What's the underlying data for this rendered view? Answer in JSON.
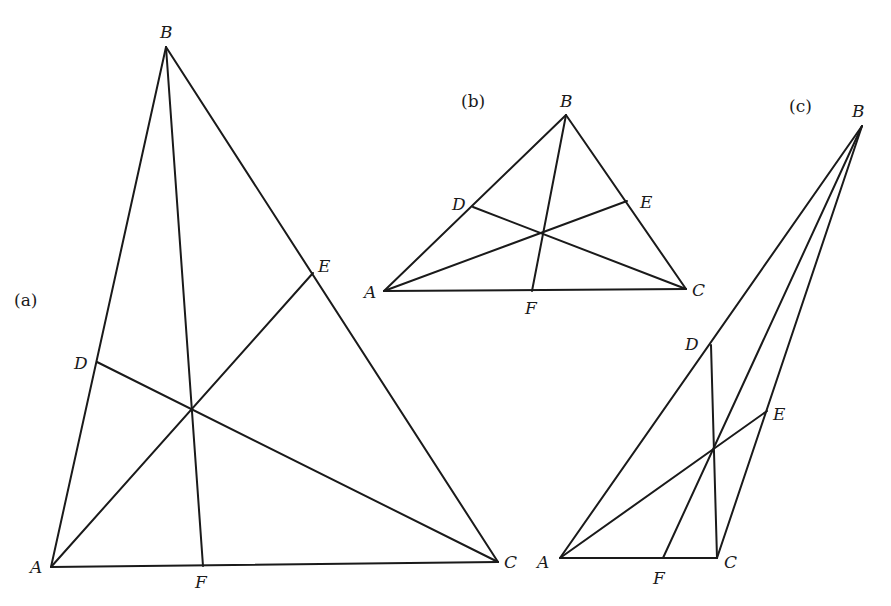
{
  "figures": [
    {
      "id": "a",
      "tag": "(a)",
      "tag_pos": [
        14,
        306
      ],
      "points": {
        "A": {
          "xy": [
            51,
            567
          ],
          "label_pos": [
            30,
            573
          ]
        },
        "B": {
          "xy": [
            166,
            47
          ],
          "label_pos": [
            160,
            38
          ]
        },
        "C": {
          "xy": [
            498,
            562
          ],
          "label_pos": [
            504,
            568
          ]
        },
        "D": {
          "xy": [
            97,
            362
          ],
          "label_pos": [
            74,
            369
          ]
        },
        "E": {
          "xy": [
            313,
            273
          ],
          "label_pos": [
            318,
            272
          ]
        },
        "F": {
          "xy": [
            203,
            566
          ],
          "label_pos": [
            195,
            588
          ]
        }
      },
      "concurrency_point": [
        192,
        407
      ],
      "sides": [
        [
          "A",
          "B"
        ],
        [
          "B",
          "C"
        ],
        [
          "C",
          "A"
        ]
      ],
      "cevians": [
        [
          "A",
          "E"
        ],
        [
          "B",
          "F"
        ],
        [
          "C",
          "D"
        ]
      ]
    },
    {
      "id": "b",
      "tag": "(b)",
      "tag_pos": [
        461,
        107
      ],
      "points": {
        "A": {
          "xy": [
            384,
            291
          ],
          "label_pos": [
            364,
            298
          ]
        },
        "B": {
          "xy": [
            566,
            115
          ],
          "label_pos": [
            560,
            107
          ]
        },
        "C": {
          "xy": [
            686,
            289
          ],
          "label_pos": [
            692,
            296
          ]
        },
        "D": {
          "xy": [
            473,
            207
          ],
          "label_pos": [
            452,
            210
          ]
        },
        "E": {
          "xy": [
            627,
            201
          ],
          "label_pos": [
            640,
            208
          ]
        },
        "F": {
          "xy": [
            532,
            291
          ],
          "label_pos": [
            525,
            314
          ]
        }
      },
      "concurrency_point": [
        542,
        233
      ],
      "sides": [
        [
          "A",
          "B"
        ],
        [
          "B",
          "C"
        ],
        [
          "C",
          "A"
        ]
      ],
      "cevians": [
        [
          "A",
          "E"
        ],
        [
          "B",
          "F"
        ],
        [
          "C",
          "D"
        ]
      ]
    },
    {
      "id": "c",
      "tag": "(c)",
      "tag_pos": [
        789,
        112
      ],
      "points": {
        "A": {
          "xy": [
            560,
            558
          ],
          "label_pos": [
            537,
            568
          ]
        },
        "B": {
          "xy": [
            862,
            126
          ],
          "label_pos": [
            852,
            117
          ]
        },
        "C": {
          "xy": [
            717,
            558
          ],
          "label_pos": [
            724,
            568
          ]
        },
        "D": {
          "xy": [
            711,
            345
          ],
          "label_pos": [
            685,
            350
          ]
        },
        "E": {
          "xy": [
            767,
            411
          ],
          "label_pos": [
            773,
            420
          ]
        },
        "F": {
          "xy": [
            663,
            558
          ],
          "label_pos": [
            653,
            584
          ]
        }
      },
      "concurrency_point": [
        713,
        450
      ],
      "sides": [
        [
          "A",
          "B"
        ],
        [
          "B",
          "C"
        ],
        [
          "C",
          "A"
        ]
      ],
      "cevians": [
        [
          "A",
          "E"
        ],
        [
          "B",
          "F"
        ],
        [
          "C",
          "D"
        ]
      ]
    }
  ],
  "colors": {
    "stroke": "#1a1a1a",
    "background": "#ffffff"
  }
}
